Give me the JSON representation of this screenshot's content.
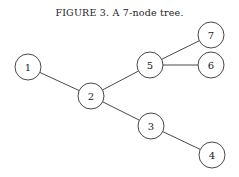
{
  "figure": {
    "caption": "FIGURE 3. A 7-node tree."
  },
  "tree": {
    "node_radius": 13,
    "nodes": [
      {
        "id": "1",
        "label": "1",
        "x": 28,
        "y": 67
      },
      {
        "id": "2",
        "label": "2",
        "x": 91,
        "y": 96
      },
      {
        "id": "3",
        "label": "3",
        "x": 151,
        "y": 126
      },
      {
        "id": "4",
        "label": "4",
        "x": 212,
        "y": 155
      },
      {
        "id": "5",
        "label": "5",
        "x": 150,
        "y": 65
      },
      {
        "id": "6",
        "label": "6",
        "x": 211,
        "y": 65
      },
      {
        "id": "7",
        "label": "7",
        "x": 211,
        "y": 35
      }
    ],
    "edges": [
      [
        "1",
        "2"
      ],
      [
        "2",
        "5"
      ],
      [
        "2",
        "3"
      ],
      [
        "3",
        "4"
      ],
      [
        "5",
        "6"
      ],
      [
        "5",
        "7"
      ]
    ]
  }
}
